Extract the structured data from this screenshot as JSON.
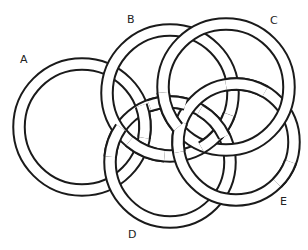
{
  "diagram": {
    "type": "interlocking rings",
    "ring_stroke_color": "#1a1a1a",
    "ring_fill_color": "#ffffff",
    "background": "#ffffff",
    "rings": [
      {
        "id": "A",
        "label": "A",
        "cx": 82,
        "cy": 127,
        "r": 63,
        "label_x": 20,
        "label_y": 54
      },
      {
        "id": "B",
        "label": "B",
        "cx": 170,
        "cy": 93,
        "r": 63,
        "label_x": 127,
        "label_y": 14
      },
      {
        "id": "C",
        "label": "C",
        "cx": 226,
        "cy": 87,
        "r": 63,
        "label_x": 270,
        "label_y": 15
      },
      {
        "id": "D",
        "label": "D",
        "cx": 170,
        "cy": 162,
        "r": 60,
        "label_x": 128,
        "label_y": 229
      },
      {
        "id": "E",
        "label": "E",
        "cx": 236,
        "cy": 142,
        "r": 58,
        "label_x": 280,
        "label_y": 196
      }
    ]
  }
}
